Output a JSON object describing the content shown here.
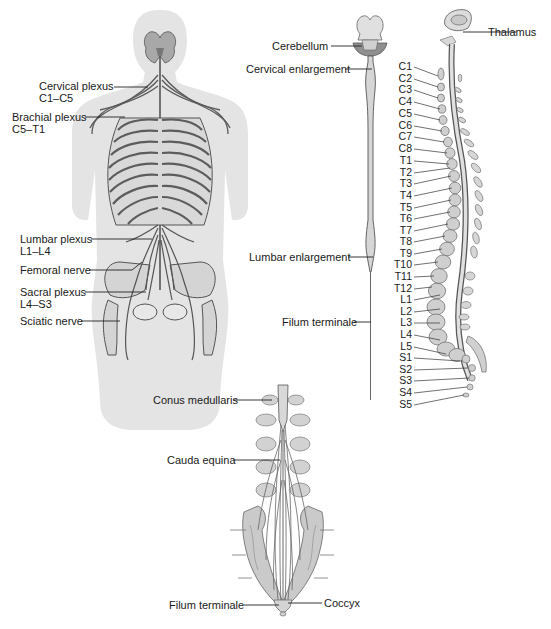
{
  "figure": {
    "panels": {
      "body": {
        "labels": [
          {
            "id": "cervical-plexus",
            "name": "Cervical plexus",
            "range": "C1–C5"
          },
          {
            "id": "brachial-plexus",
            "name": "Brachial plexus",
            "range": "C5–T1"
          },
          {
            "id": "lumbar-plexus",
            "name": "Lumbar plexus",
            "range": "L1–L4"
          },
          {
            "id": "femoral-nerve",
            "name": "Femoral nerve"
          },
          {
            "id": "sacral-plexus",
            "name": "Sacral plexus",
            "range": "L4–S3"
          },
          {
            "id": "sciatic-nerve",
            "name": "Sciatic nerve"
          }
        ]
      },
      "spinal_cord": {
        "labels": [
          {
            "id": "cerebellum",
            "name": "Cerebellum"
          },
          {
            "id": "cervical-enlargement",
            "name": "Cervical enlargement"
          },
          {
            "id": "lumbar-enlargement",
            "name": "Lumbar enlargement"
          },
          {
            "id": "filum-terminale",
            "name": "Filum terminale"
          }
        ]
      },
      "vertebral_column": {
        "thalamus_label": "Thalamus",
        "vertebrae": [
          "C1",
          "C2",
          "C3",
          "C4",
          "C5",
          "C6",
          "C7",
          "C8",
          "T1",
          "T2",
          "T3",
          "T4",
          "T5",
          "T6",
          "T7",
          "T8",
          "T9",
          "T10",
          "T11",
          "T12",
          "L1",
          "L2",
          "L3",
          "L4",
          "L5",
          "S1",
          "S2",
          "S3",
          "S4",
          "S5"
        ]
      },
      "cauda_equina": {
        "labels": [
          {
            "id": "conus-medullaris",
            "name": "Conus medullaris"
          },
          {
            "id": "cauda-equina",
            "name": "Cauda equina"
          },
          {
            "id": "filum-terminale-2",
            "name": "Filum terminale"
          },
          {
            "id": "coccyx",
            "name": "Coccyx"
          }
        ]
      }
    },
    "colors": {
      "body_silhouette": "#e4e4e4",
      "bone": "#d6d6d6",
      "nerve": "#5a5a5a",
      "outline": "#4a4a4a",
      "cerebellum": "#8a8a8a",
      "label_line": "#222222"
    }
  }
}
